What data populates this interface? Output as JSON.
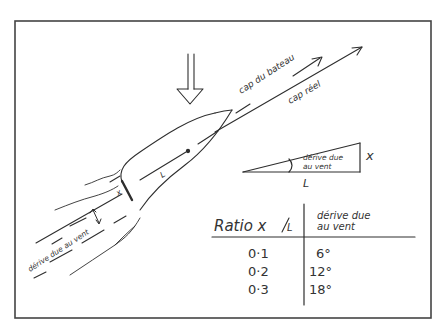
{
  "diagram": {
    "type": "hand-drawn sailing diagram",
    "colors": {
      "ink": "#2e2e2e",
      "background": "#ffffff",
      "frame": "#444444"
    },
    "labels": {
      "boat_heading": "cap du bateau",
      "actual_course": "cap réel",
      "leeway_wake": "dérive due au vent",
      "offset_symbol_small": "x",
      "length_symbol_small": "L",
      "triangle_angle_label_line1": "dérive due",
      "triangle_angle_label_line2": "au vent",
      "triangle_opposite": "x",
      "triangle_adjacent": "L"
    },
    "wind_arrow": {
      "direction": "down",
      "icon": "hollow-down-arrow-icon"
    },
    "table": {
      "header_ratio": "Ratio x/L",
      "header_ratio_main": "Ratio x",
      "header_ratio_den": "L",
      "header_drift_line1": "dérive due",
      "header_drift_line2": "au vent",
      "rows": [
        {
          "ratio": "0·1",
          "drift": "6°"
        },
        {
          "ratio": "0·2",
          "drift": "12°"
        },
        {
          "ratio": "0·3",
          "drift": "18°"
        }
      ]
    }
  }
}
